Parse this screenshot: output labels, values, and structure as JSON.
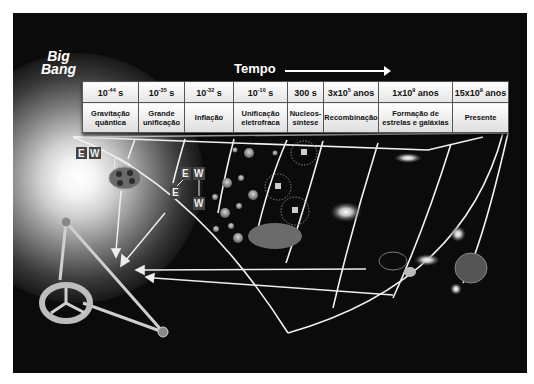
{
  "title": {
    "big_bang_line1": "Big",
    "big_bang_line2": "Bang",
    "time_axis_label": "Tempo"
  },
  "timeline": {
    "columns": [
      {
        "time_base": "10",
        "time_exp": "-44",
        "time_unit": " s",
        "era_line1": "Gravitação",
        "era_line2": "quântica"
      },
      {
        "time_base": "10",
        "time_exp": "-35",
        "time_unit": " s",
        "era_line1": "Grande",
        "era_line2": "unificação"
      },
      {
        "time_base": "10",
        "time_exp": "-32",
        "time_unit": " s",
        "era_line1": "Inflação",
        "era_line2": ""
      },
      {
        "time_base": "10",
        "time_exp": "-10",
        "time_unit": " s",
        "era_line1": "Unificação",
        "era_line2": "eletrofraca"
      },
      {
        "time_base": "300 s",
        "time_exp": "",
        "time_unit": "",
        "era_line1": "Nucleos-",
        "era_line2": "síntese"
      },
      {
        "time_base": "3x10",
        "time_exp": "5",
        "time_unit": " anos",
        "era_line1": "Recombinação",
        "era_line2": ""
      },
      {
        "time_base": "1x10",
        "time_exp": "9",
        "time_unit": " anos",
        "era_line1": "Formação de",
        "era_line2": "estrelas e galáxias"
      },
      {
        "time_base": "15x10",
        "time_exp": "9",
        "time_unit": " anos",
        "era_line1": "Presente",
        "era_line2": ""
      }
    ]
  },
  "particle_labels": {
    "ew_pair_top": [
      "E",
      "W"
    ],
    "ew_split_top": [
      "E",
      "W"
    ],
    "ew_split_bottom": [
      "E",
      "W"
    ]
  },
  "colors": {
    "background": "#0b0b0b",
    "lines": "#f2f2f2",
    "table_fill": "#f4f4f4"
  }
}
